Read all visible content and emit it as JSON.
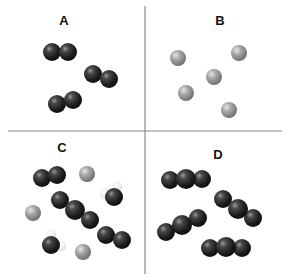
{
  "diagram": {
    "type": "particle-model-panels",
    "colors": {
      "dark_atom": "#2a2a2a",
      "gray_atom": "#9a9a9a",
      "hydrogen_atom": "#f2f2f2",
      "divider": "#8a8a8a",
      "background": "#ffffff"
    },
    "dividers": {
      "vertical": {
        "x": 145,
        "y1": 6,
        "y2": 274
      },
      "horizontal": {
        "y": 131,
        "x1": 8,
        "x2": 282
      }
    },
    "panels": [
      {
        "label": "A",
        "label_pos": [
          64,
          14
        ],
        "description": "Three diatomic molecules of dark atoms",
        "molecules": [
          {
            "atoms": [
              {
                "x": 52,
                "y": 52,
                "r": 9,
                "kind": "dark"
              },
              {
                "x": 68,
                "y": 52,
                "r": 9,
                "kind": "dark"
              }
            ]
          },
          {
            "atoms": [
              {
                "x": 93,
                "y": 74,
                "r": 9,
                "kind": "dark"
              },
              {
                "x": 109,
                "y": 79,
                "r": 9,
                "kind": "dark"
              }
            ]
          },
          {
            "atoms": [
              {
                "x": 57,
                "y": 104,
                "r": 9,
                "kind": "dark"
              },
              {
                "x": 73,
                "y": 100,
                "r": 9,
                "kind": "dark"
              }
            ]
          }
        ]
      },
      {
        "label": "B",
        "label_pos": [
          220,
          14
        ],
        "description": "Five single gray atoms",
        "molecules": [
          {
            "atoms": [
              {
                "x": 178,
                "y": 58,
                "r": 8,
                "kind": "gray"
              }
            ]
          },
          {
            "atoms": [
              {
                "x": 239,
                "y": 53,
                "r": 8,
                "kind": "gray"
              }
            ]
          },
          {
            "atoms": [
              {
                "x": 214,
                "y": 77,
                "r": 8,
                "kind": "gray"
              }
            ]
          },
          {
            "atoms": [
              {
                "x": 186,
                "y": 93,
                "r": 8,
                "kind": "gray"
              }
            ]
          },
          {
            "atoms": [
              {
                "x": 229,
                "y": 110,
                "r": 8,
                "kind": "gray"
              }
            ]
          }
        ]
      },
      {
        "label": "C",
        "label_pos": [
          62,
          141
        ],
        "description": "Mixture of diatomic, triatomic, single gray atoms and molecules with small white atoms",
        "molecules": [
          {
            "atoms": [
              {
                "x": 42,
                "y": 178,
                "r": 9,
                "kind": "dark"
              },
              {
                "x": 57,
                "y": 175,
                "r": 9,
                "kind": "dark"
              }
            ]
          },
          {
            "atoms": [
              {
                "x": 87,
                "y": 174,
                "r": 8,
                "kind": "gray"
              }
            ]
          },
          {
            "atoms": [
              {
                "x": 33,
                "y": 213,
                "r": 8,
                "kind": "gray"
              }
            ]
          },
          {
            "atoms": [
              {
                "x": 83,
                "y": 252,
                "r": 8,
                "kind": "gray"
              }
            ]
          },
          {
            "atoms": [
              {
                "x": 60,
                "y": 200,
                "r": 9,
                "kind": "dark"
              },
              {
                "x": 75,
                "y": 210,
                "r": 10,
                "kind": "dark"
              },
              {
                "x": 90,
                "y": 220,
                "r": 9,
                "kind": "dark"
              }
            ]
          },
          {
            "atoms": [
              {
                "x": 106,
                "y": 235,
                "r": 9,
                "kind": "dark"
              },
              {
                "x": 122,
                "y": 240,
                "r": 9,
                "kind": "dark"
              }
            ]
          },
          {
            "atoms": [
              {
                "x": 117,
                "y": 186,
                "r": 5,
                "kind": "hydrogen"
              },
              {
                "x": 105,
                "y": 194,
                "r": 5,
                "kind": "hydrogen"
              },
              {
                "x": 114,
                "y": 197,
                "r": 9,
                "kind": "dark"
              }
            ]
          },
          {
            "atoms": [
              {
                "x": 51,
                "y": 234,
                "r": 5,
                "kind": "hydrogen"
              },
              {
                "x": 61,
                "y": 246,
                "r": 5,
                "kind": "hydrogen"
              },
              {
                "x": 51,
                "y": 245,
                "r": 9,
                "kind": "dark"
              }
            ]
          }
        ]
      },
      {
        "label": "D",
        "label_pos": [
          218,
          148
        ],
        "description": "Four triatomic molecules of dark atoms",
        "molecules": [
          {
            "atoms": [
              {
                "x": 170,
                "y": 180,
                "r": 9,
                "kind": "dark"
              },
              {
                "x": 202,
                "y": 179,
                "r": 9,
                "kind": "dark"
              },
              {
                "x": 186,
                "y": 179,
                "r": 10,
                "kind": "dark"
              }
            ]
          },
          {
            "atoms": [
              {
                "x": 223,
                "y": 199,
                "r": 9,
                "kind": "dark"
              },
              {
                "x": 253,
                "y": 218,
                "r": 9,
                "kind": "dark"
              },
              {
                "x": 238,
                "y": 209,
                "r": 10,
                "kind": "dark"
              }
            ]
          },
          {
            "atoms": [
              {
                "x": 166,
                "y": 232,
                "r": 9,
                "kind": "dark"
              },
              {
                "x": 198,
                "y": 218,
                "r": 9,
                "kind": "dark"
              },
              {
                "x": 182,
                "y": 225,
                "r": 10,
                "kind": "dark"
              }
            ]
          },
          {
            "atoms": [
              {
                "x": 210,
                "y": 248,
                "r": 9,
                "kind": "dark"
              },
              {
                "x": 242,
                "y": 248,
                "r": 9,
                "kind": "dark"
              },
              {
                "x": 226,
                "y": 247,
                "r": 10,
                "kind": "dark"
              }
            ]
          }
        ]
      }
    ]
  }
}
